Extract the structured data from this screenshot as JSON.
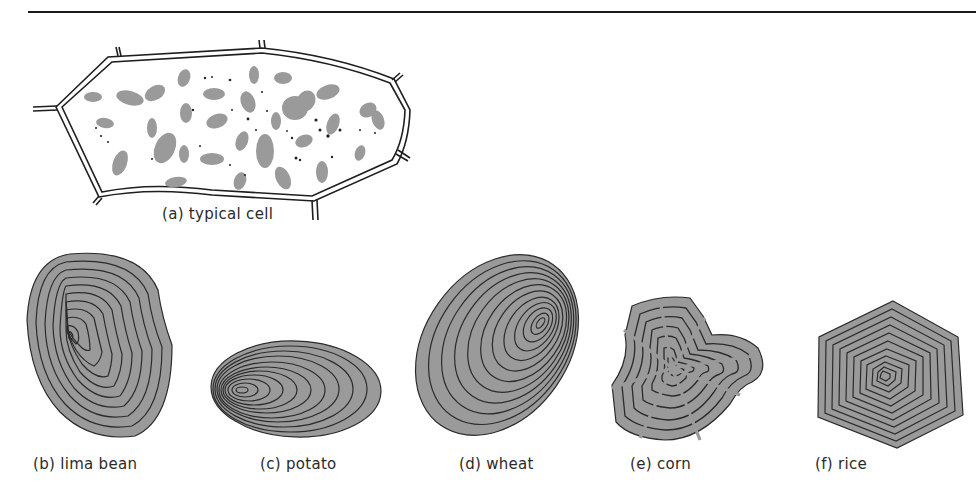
{
  "figure": {
    "panels": [
      {
        "id": "a",
        "label": "(a) typical cell"
      },
      {
        "id": "b",
        "label": "(b) lima bean"
      },
      {
        "id": "c",
        "label": "(c) potato"
      },
      {
        "id": "d",
        "label": "(d) wheat"
      },
      {
        "id": "e",
        "label": "(e) corn"
      },
      {
        "id": "f",
        "label": "(f) rice"
      }
    ],
    "colors": {
      "grain_fill": "#9a9a9a",
      "ring_line": "#2b2b2b",
      "wall": "#1e1e1e"
    }
  }
}
